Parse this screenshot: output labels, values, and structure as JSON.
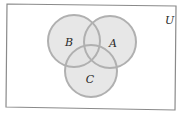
{
  "diagram": {
    "type": "venn",
    "universe": {
      "label": "U",
      "corners": [
        [
          7,
          4
        ],
        [
          176,
          6
        ],
        [
          175,
          110
        ],
        [
          6,
          107
        ]
      ],
      "stroke": "#8a8a8a",
      "fill": "#ffffff"
    },
    "sets": [
      {
        "label": "B",
        "cx": 74,
        "cy": 41,
        "r": 26,
        "label_x": 69,
        "label_y": 46
      },
      {
        "label": "A",
        "cx": 110,
        "cy": 42,
        "r": 26,
        "label_x": 113,
        "label_y": 47
      },
      {
        "label": "C",
        "cx": 91,
        "cy": 71,
        "r": 26,
        "label_x": 90,
        "label_y": 83
      }
    ],
    "circle_fill": "#e3e3e3",
    "circle_stroke": "#b0b0b0",
    "universe_label_pos": [
      165,
      24
    ]
  }
}
